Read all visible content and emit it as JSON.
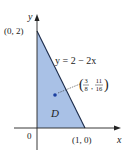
{
  "diagram": {
    "axes": {
      "x_label": "x",
      "y_label": "y",
      "origin_label": "0"
    },
    "points": {
      "top": "(0, 2)",
      "right": "(1, 0)"
    },
    "line_label": "y = 2 − 2x",
    "region_label": "D",
    "centroid": {
      "num1": "3",
      "den1": "8",
      "num2": "11",
      "den2": "16"
    },
    "colors": {
      "region_fill": "#a9c1e6",
      "edge": "#1a2a4a",
      "point": "#1b3fa0"
    }
  }
}
